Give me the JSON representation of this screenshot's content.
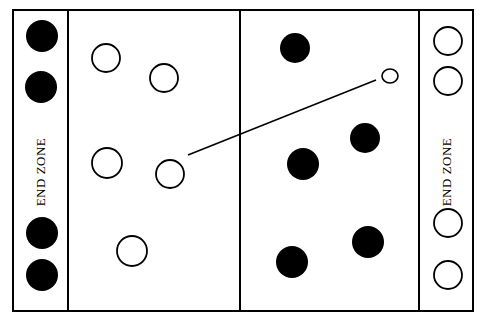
{
  "diagram": {
    "field": {
      "outer": {
        "x": 13,
        "y": 10,
        "w": 460,
        "h": 301
      },
      "left_endzone_line_x": 68,
      "midline_x": 240,
      "right_endzone_line_x": 419,
      "stroke": "#000000"
    },
    "end_zones": [
      {
        "side": "left",
        "label": "END ZONE",
        "cx": 42,
        "cy": 172,
        "rotate": -90
      },
      {
        "side": "right",
        "label": "END ZONE",
        "cx": 448,
        "cy": 172,
        "rotate": -90
      }
    ],
    "team_dark": {
      "name": "dark team",
      "fill": "#000000",
      "players": [
        {
          "cx": 42,
          "cy": 36,
          "r": 16
        },
        {
          "cx": 41,
          "cy": 87,
          "r": 16
        },
        {
          "cx": 42,
          "cy": 233,
          "r": 16
        },
        {
          "cx": 42,
          "cy": 275,
          "r": 16
        },
        {
          "cx": 295,
          "cy": 48,
          "r": 15
        },
        {
          "cx": 365,
          "cy": 138,
          "r": 15
        },
        {
          "cx": 303,
          "cy": 164,
          "r": 16
        },
        {
          "cx": 368,
          "cy": 242,
          "r": 16
        },
        {
          "cx": 292,
          "cy": 262,
          "r": 16
        }
      ]
    },
    "team_light": {
      "name": "light team",
      "fill": "#ffffff",
      "stroke": "#000000",
      "players": [
        {
          "cx": 106,
          "cy": 58,
          "r": 14
        },
        {
          "cx": 164,
          "cy": 78,
          "r": 14
        },
        {
          "cx": 107,
          "cy": 163,
          "r": 15
        },
        {
          "cx": 170,
          "cy": 174,
          "r": 14
        },
        {
          "cx": 132,
          "cy": 251,
          "r": 15
        },
        {
          "cx": 448,
          "cy": 41,
          "r": 14
        },
        {
          "cx": 448,
          "cy": 81,
          "r": 14
        },
        {
          "cx": 448,
          "cy": 223,
          "r": 14
        },
        {
          "cx": 448,
          "cy": 275,
          "r": 14
        }
      ]
    },
    "disc": {
      "cx": 390,
      "cy": 76,
      "rx": 8,
      "ry": 7
    },
    "pass_line": {
      "x1": 188,
      "y1": 155,
      "x2": 376,
      "y2": 80
    }
  }
}
